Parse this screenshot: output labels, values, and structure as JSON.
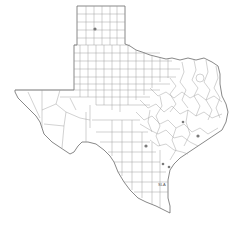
{
  "map": {
    "subject": "Texas county map",
    "colors": {
      "background": "#ffffff",
      "outline": "#6a6a6a",
      "county_lines": "#9a9a9a",
      "markers": "#7a7a7a"
    },
    "markers": [
      {
        "id": "panhandle",
        "x": 95,
        "y": 29
      },
      {
        "id": "central-texas",
        "x": 146,
        "y": 146
      },
      {
        "id": "east-central",
        "x": 183,
        "y": 122
      },
      {
        "id": "southeast",
        "x": 198,
        "y": 136
      },
      {
        "id": "coastal-1",
        "x": 163,
        "y": 164
      },
      {
        "id": "coastal-2",
        "x": 169,
        "y": 167
      }
    ],
    "coastal_label": "SLA"
  }
}
